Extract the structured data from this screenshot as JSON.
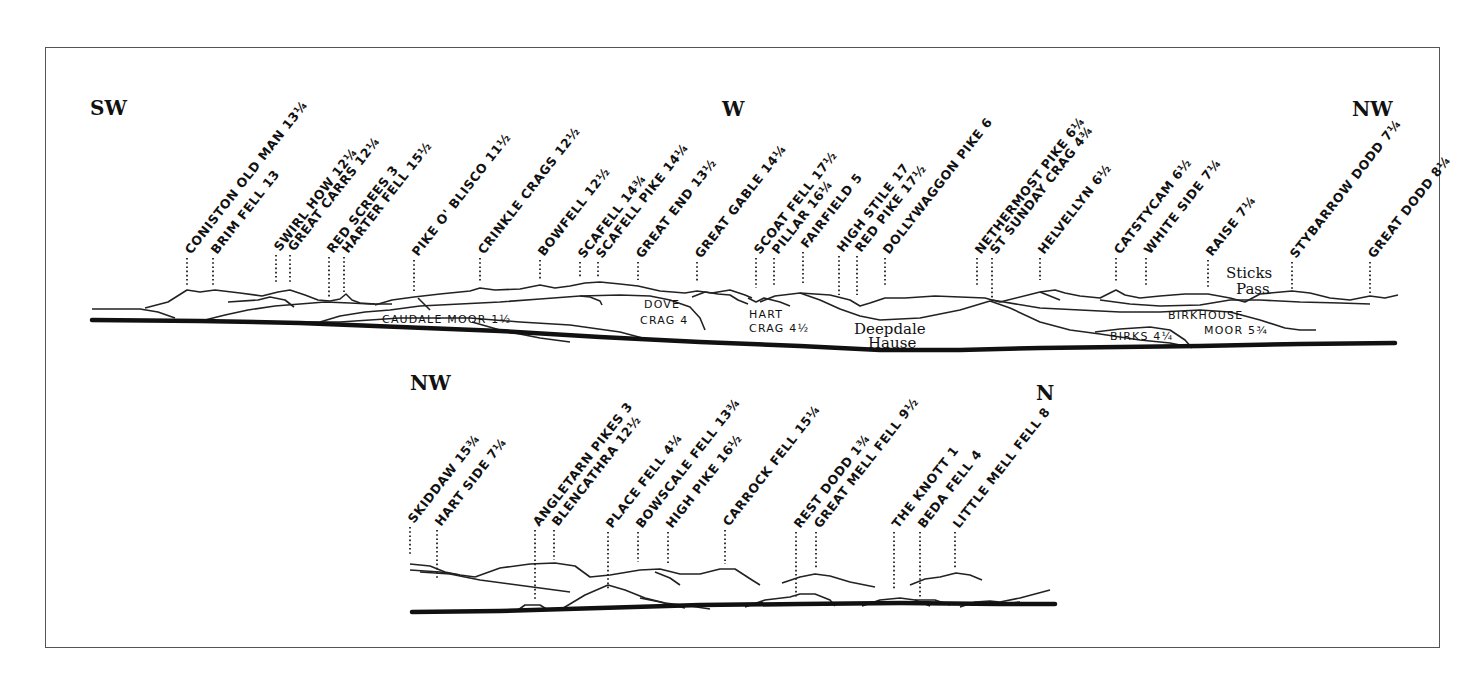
{
  "panels": [
    {
      "id": "upper",
      "compass": [
        {
          "label": "SW",
          "x": 90,
          "y": 115
        },
        {
          "label": "W",
          "x": 722,
          "y": 116
        },
        {
          "label": "NW",
          "x": 1352,
          "y": 116
        }
      ],
      "peaks": [
        {
          "name": "CONISTON OLD MAN 13¼",
          "x": 187,
          "y_top": 258,
          "y_bottom": 286
        },
        {
          "name": "BRIM FELL 13",
          "x": 213,
          "y_top": 258,
          "y_bottom": 286
        },
        {
          "name": "SWIRL HOW 12¼",
          "x": 276,
          "y_top": 255,
          "y_bottom": 284
        },
        {
          "name": "GREAT CARRS 12¼",
          "x": 290,
          "y_top": 255,
          "y_bottom": 284
        },
        {
          "name": "RED SCREES 3",
          "x": 329,
          "y_top": 257,
          "y_bottom": 298
        },
        {
          "name": "HARTER FELL 15½",
          "x": 344,
          "y_top": 257,
          "y_bottom": 292
        },
        {
          "name": "PIKE O' BLISCO 11½",
          "x": 414,
          "y_top": 260,
          "y_bottom": 292
        },
        {
          "name": "CRINKLE CRAGS 12½",
          "x": 480,
          "y_top": 258,
          "y_bottom": 283
        },
        {
          "name": "BOWFELL 12½",
          "x": 540,
          "y_top": 260,
          "y_bottom": 281
        },
        {
          "name": "SCAFELL 14¾",
          "x": 580,
          "y_top": 262,
          "y_bottom": 277
        },
        {
          "name": "SCAFELL PIKE 14¼",
          "x": 598,
          "y_top": 262,
          "y_bottom": 277
        },
        {
          "name": "GREAT END 13½",
          "x": 638,
          "y_top": 262,
          "y_bottom": 280
        },
        {
          "name": "GREAT GABLE 14¼",
          "x": 697,
          "y_top": 262,
          "y_bottom": 283
        },
        {
          "name": "SCOAT FELL 17½",
          "x": 756,
          "y_top": 258,
          "y_bottom": 288
        },
        {
          "name": "PILLAR 16¼",
          "x": 774,
          "y_top": 258,
          "y_bottom": 285
        },
        {
          "name": "FAIRFIELD 5",
          "x": 803,
          "y_top": 252,
          "y_bottom": 285
        },
        {
          "name": "HIGH STILE 17",
          "x": 839,
          "y_top": 256,
          "y_bottom": 295
        },
        {
          "name": "RED PIKE 17½",
          "x": 857,
          "y_top": 256,
          "y_bottom": 295
        },
        {
          "name": "DOLLYWAGGON PIKE 6",
          "x": 885,
          "y_top": 258,
          "y_bottom": 287
        },
        {
          "name": "NETHERMOST PIKE 6¼",
          "x": 977,
          "y_top": 258,
          "y_bottom": 287
        },
        {
          "name": "ST SUNDAY CRAG 4¾",
          "x": 992,
          "y_top": 258,
          "y_bottom": 303
        },
        {
          "name": "HELVELLYN 6½",
          "x": 1040,
          "y_top": 258,
          "y_bottom": 280
        },
        {
          "name": "CATSTYCAM 6½",
          "x": 1116,
          "y_top": 258,
          "y_bottom": 283
        },
        {
          "name": "WHITE SIDE 7¼",
          "x": 1146,
          "y_top": 258,
          "y_bottom": 287
        },
        {
          "name": "RAISE 7¼",
          "x": 1208,
          "y_top": 260,
          "y_bottom": 288
        },
        {
          "name": "STYBARROW DODD 7¼",
          "x": 1292,
          "y_top": 262,
          "y_bottom": 289
        },
        {
          "name": "GREAT DODD 8¼",
          "x": 1370,
          "y_top": 262,
          "y_bottom": 293
        }
      ],
      "areas": [
        {
          "name": "CAUDALE MOOR 1½",
          "x": 382,
          "y": 323
        },
        {
          "name": "DOVE",
          "x": 644,
          "y": 308
        },
        {
          "name": "CRAG 4",
          "x": 640,
          "y": 324
        },
        {
          "name": "HART",
          "x": 749,
          "y": 318
        },
        {
          "name": "CRAG 4½",
          "x": 749,
          "y": 332
        },
        {
          "name": "BIRKHOUSE",
          "x": 1168,
          "y": 319
        },
        {
          "name": "MOOR 5¾",
          "x": 1204,
          "y": 334
        },
        {
          "name": "BIRKS 4¼",
          "x": 1110,
          "y": 340
        }
      ],
      "script_labels": [
        {
          "name": "Sticks",
          "x": 1226,
          "y": 278
        },
        {
          "name": "Pass",
          "x": 1236,
          "y": 294
        },
        {
          "name": "Deepdale",
          "x": 854,
          "y": 334
        },
        {
          "name": "Hause",
          "x": 868,
          "y": 348
        }
      ]
    },
    {
      "id": "lower",
      "compass": [
        {
          "label": "NW",
          "x": 410,
          "y": 390
        },
        {
          "label": "N",
          "x": 1036,
          "y": 400
        }
      ],
      "peaks": [
        {
          "name": "SKIDDAW 15¾",
          "x": 410,
          "y_top": 527,
          "y_bottom": 555
        },
        {
          "name": "HART SIDE 7¼",
          "x": 437,
          "y_top": 530,
          "y_bottom": 580
        },
        {
          "name": "ANGLETARN PIKES 3",
          "x": 535,
          "y_top": 530,
          "y_bottom": 600
        },
        {
          "name": "BLENCATHRA 12½",
          "x": 554,
          "y_top": 530,
          "y_bottom": 560
        },
        {
          "name": "PLACE FELL 4¼",
          "x": 608,
          "y_top": 532,
          "y_bottom": 590
        },
        {
          "name": "BOWSCALE FELL 13¾",
          "x": 638,
          "y_top": 532,
          "y_bottom": 562
        },
        {
          "name": "HIGH PIKE 16½",
          "x": 668,
          "y_top": 532,
          "y_bottom": 564
        },
        {
          "name": "CARROCK FELL 15¼",
          "x": 725,
          "y_top": 530,
          "y_bottom": 564
        },
        {
          "name": "REST DODD 1¾",
          "x": 796,
          "y_top": 532,
          "y_bottom": 598
        },
        {
          "name": "GREAT MELL FELL 9½",
          "x": 816,
          "y_top": 532,
          "y_bottom": 568
        },
        {
          "name": "THE KNOTT 1",
          "x": 894,
          "y_top": 532,
          "y_bottom": 590
        },
        {
          "name": "BEDA FELL 4",
          "x": 920,
          "y_top": 532,
          "y_bottom": 598
        },
        {
          "name": "LITTLE MELL FELL 8",
          "x": 955,
          "y_top": 532,
          "y_bottom": 568
        }
      ],
      "areas": [],
      "script_labels": []
    }
  ]
}
